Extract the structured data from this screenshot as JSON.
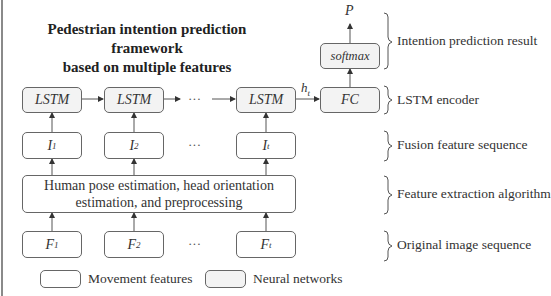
{
  "title": {
    "line1": "Pedestrian intention prediction framework",
    "line2": "based on multiple features"
  },
  "nodes": {
    "lstm": [
      "LSTM",
      "LSTM",
      "LSTM"
    ],
    "fc": "FC",
    "softmax": "softmax",
    "output": "P",
    "hidden_label": "h",
    "hidden_sub": "t",
    "fusion": [
      {
        "base": "I",
        "sub": "1"
      },
      {
        "base": "I",
        "sub": "2"
      },
      {
        "base": "I",
        "sub": "t"
      }
    ],
    "feature_extraction": {
      "line1": "Human pose estimation, head orientation",
      "line2": "estimation, and preprocessing"
    },
    "frames": [
      {
        "base": "F",
        "sub": "1"
      },
      {
        "base": "F",
        "sub": "2"
      },
      {
        "base": "F",
        "sub": "t"
      }
    ],
    "ellipsis": "···"
  },
  "stages": [
    "Intention prediction result",
    "LSTM encoder",
    "Fusion feature sequence",
    "Feature extraction algorithm",
    "Original image sequence"
  ],
  "legend": [
    {
      "label": "Movement features",
      "fill": "#ffffff"
    },
    {
      "label": "Neural networks",
      "fill": "#f3f3f3"
    }
  ],
  "colors": {
    "stroke": "#666666",
    "nn_fill": "#f3f3f3",
    "movement_fill": "#ffffff"
  }
}
